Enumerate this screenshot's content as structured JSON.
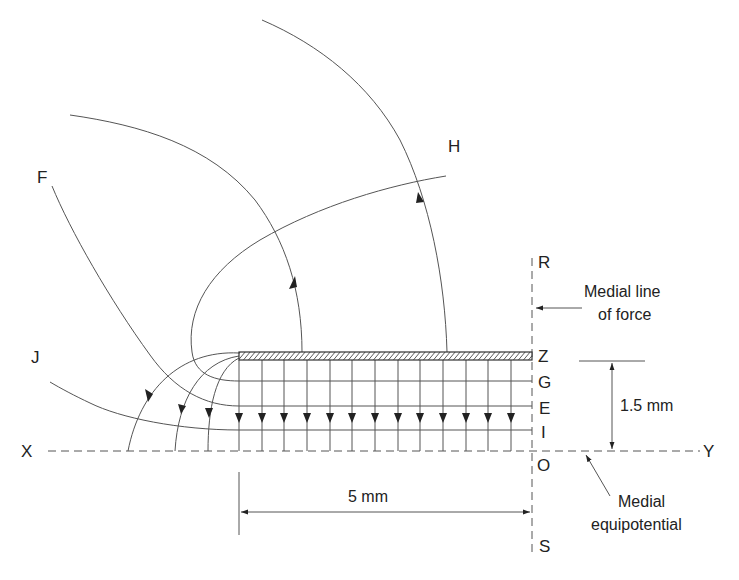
{
  "figure": {
    "type": "field-lines-diagram",
    "colors": {
      "line": "#555555",
      "text": "#222222",
      "background": "#ffffff"
    }
  },
  "labels": {
    "F": "F",
    "H": "H",
    "J": "J",
    "R": "R",
    "Z": "Z",
    "G": "G",
    "E": "E",
    "I": "I",
    "O": "O",
    "S": "S",
    "X": "X",
    "Y": "Y"
  },
  "annotations": {
    "medial_line_of_force_1": "Medial line",
    "medial_line_of_force_2": "of force",
    "medial_equipotential_1": "Medial",
    "medial_equipotential_2": "equipotential",
    "height_dimension": "1.5 mm",
    "width_dimension": "5 mm"
  },
  "geometry": {
    "plate": {
      "x1": 239,
      "x2": 532,
      "y_top": 352,
      "y_bottom": 360
    },
    "axis_y": 451,
    "medial_x": 532,
    "equipotentials_y": {
      "G": 381,
      "E": 406,
      "I": 430
    },
    "field_line_xs": [
      239,
      262,
      284,
      307,
      330,
      352,
      375,
      398,
      420,
      443,
      466,
      488,
      511
    ],
    "arrow_y": 418
  }
}
